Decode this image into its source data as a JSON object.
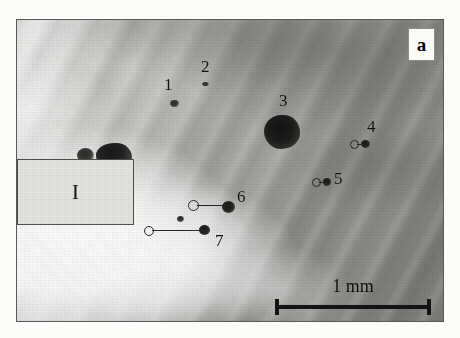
{
  "figure": {
    "panel_letter": "a",
    "inset_label": "I",
    "type": "grayscale micrograph"
  },
  "scalebar": {
    "label": "1 mm",
    "length_px": 156,
    "x": 258,
    "y": 279
  },
  "markers": [
    {
      "id": "1",
      "label": "1",
      "label_x": 147,
      "label_y": 56,
      "spot_x": 153,
      "spot_y": 80,
      "spot_w": 9,
      "spot_h": 7,
      "style": "soft",
      "leader": false
    },
    {
      "id": "2",
      "label": "2",
      "label_x": 184,
      "label_y": 38,
      "spot_x": 185,
      "spot_y": 62,
      "spot_w": 7,
      "spot_h": 4,
      "style": "soft",
      "leader": false
    },
    {
      "id": "3",
      "label": "3",
      "label_x": 262,
      "label_y": 72,
      "spot_x": 247,
      "spot_y": 95,
      "spot_w": 36,
      "spot_h": 34,
      "style": "major",
      "leader": false
    },
    {
      "id": "4",
      "label": "4",
      "label_x": 350,
      "label_y": 98,
      "spot_x": 344,
      "spot_y": 120,
      "spot_w": 9,
      "spot_h": 8,
      "style": "dark",
      "leader": true,
      "ring_x": 333,
      "ring_y": 120,
      "ring_d": 7,
      "leader_len": 8
    },
    {
      "id": "5",
      "label": "5",
      "label_x": 317,
      "label_y": 150,
      "spot_x": 306,
      "spot_y": 158,
      "spot_w": 8,
      "spot_h": 8,
      "style": "dark",
      "leader": true,
      "ring_x": 295,
      "ring_y": 158,
      "ring_d": 7,
      "leader_len": 9
    },
    {
      "id": "6",
      "label": "6",
      "label_x": 220,
      "label_y": 168,
      "spot_x": 205,
      "spot_y": 181,
      "spot_w": 13,
      "spot_h": 12,
      "style": "dark",
      "leader": true,
      "ring_x": 171,
      "ring_y": 180,
      "ring_d": 9,
      "leader_len": 32
    },
    {
      "id": "7",
      "label": "7",
      "label_x": 198,
      "label_y": 212,
      "spot_x": 182,
      "spot_y": 205,
      "spot_w": 11,
      "spot_h": 10,
      "style": "dark",
      "leader": true,
      "ring_x": 127,
      "ring_y": 206,
      "ring_d": 8,
      "leader_len": 54
    }
  ],
  "inclusions": [
    {
      "name": "edge-blob-large",
      "x": 79,
      "y": 123,
      "w": 36,
      "h": 27,
      "style": "major"
    },
    {
      "name": "edge-blob-small",
      "x": 60,
      "y": 128,
      "w": 17,
      "h": 15,
      "style": "soft"
    },
    {
      "name": "edge-blob-lower",
      "x": 100,
      "y": 188,
      "w": 14,
      "h": 17,
      "style": "soft"
    },
    {
      "name": "edge-blob-tiny",
      "x": 160,
      "y": 196,
      "w": 7,
      "h": 6,
      "style": "soft"
    }
  ],
  "colors": {
    "ink": "#141414",
    "frame": "#5a5a58",
    "inset_fill": "#e3e3e0",
    "badge_fill": "#fbfbfa",
    "page": "#fdfdfc"
  }
}
